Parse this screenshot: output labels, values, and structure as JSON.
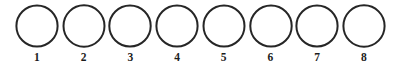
{
  "figure": {
    "name": "row-of-numbered-circles",
    "background_color": "#ffffff",
    "stroke_color": "#262626",
    "label_color": "#1c1c1c",
    "circle_count": 8,
    "circles": [
      {
        "label": "1",
        "shape": "circle-outline"
      },
      {
        "label": "2",
        "shape": "circle-outline"
      },
      {
        "label": "3",
        "shape": "circle-outline"
      },
      {
        "label": "4",
        "shape": "circle-outline"
      },
      {
        "label": "5",
        "shape": "circle-outline"
      },
      {
        "label": "6",
        "shape": "circle-outline"
      },
      {
        "label": "7",
        "shape": "circle-outline"
      },
      {
        "label": "8",
        "shape": "circle-outline"
      }
    ]
  }
}
